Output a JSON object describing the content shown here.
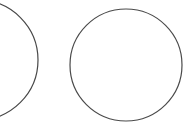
{
  "canvas": {
    "width": 189,
    "height": 129,
    "background_color": "#ffffff",
    "name": "circle-outlines-image"
  },
  "style": {
    "stroke_color": "#474747",
    "stroke_width": 1.2,
    "fill": "none"
  },
  "shapes": [
    {
      "id": "circle-left",
      "name": "circle-outline-left",
      "type": "circle",
      "cx": -22,
      "cy": 60,
      "r": 60,
      "clipped": "left-edge",
      "stroke_color": "#474747",
      "stroke_width": 1.2
    },
    {
      "id": "circle-center",
      "name": "circle-outline-center",
      "type": "circle",
      "cx": 126,
      "cy": 65,
      "r": 56,
      "clipped": "none",
      "stroke_color": "#4a4a4a",
      "stroke_width": 1.2
    }
  ]
}
